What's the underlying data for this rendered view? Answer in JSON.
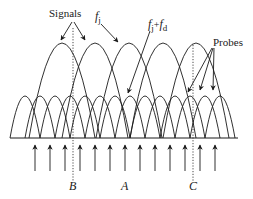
{
  "diagram": {
    "labels": {
      "signals": "Signals",
      "fj_main": "f",
      "fj_sub": "j",
      "fjfd_f1": "f",
      "fjfd_sub1": "j",
      "fjfd_plus": "+",
      "fjfd_f2": "f",
      "fjfd_sub2": "d",
      "probes": "Probes",
      "marker_b": "B",
      "marker_a": "A",
      "marker_c": "C"
    },
    "baseline": {
      "y": 138,
      "x1": 10,
      "x2": 238
    },
    "large_arcs": {
      "peak_y": 43,
      "half_width": 33,
      "centers": [
        62,
        95,
        129,
        163,
        196
      ]
    },
    "small_arcs": {
      "peak_y": 96,
      "half_width": 15,
      "centers": [
        25,
        40,
        55,
        70,
        85,
        100,
        115,
        130,
        145,
        160,
        175,
        190,
        205,
        220
      ]
    },
    "dotted_lines": [
      {
        "name": "B",
        "x": 73,
        "y1": 28,
        "y2": 182
      },
      {
        "name": "C",
        "x": 193,
        "y1": 45,
        "y2": 182
      }
    ],
    "probe_arrows": {
      "y_tail": 171,
      "y_head": 145,
      "xs": [
        35,
        50,
        65,
        80,
        95,
        110,
        125,
        140,
        155,
        170,
        185,
        200,
        215
      ]
    },
    "colors": {
      "ink": "#1a1a1a",
      "background": "#ffffff"
    }
  }
}
